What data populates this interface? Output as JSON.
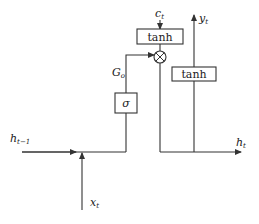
{
  "diagram": {
    "type": "lstm-output-gate",
    "colors": {
      "stroke": "#333333",
      "text": "#1a1a1a",
      "background": "#ffffff"
    },
    "labels": {
      "cell_state": "c",
      "cell_state_sub": "t",
      "output": "y",
      "output_sub": "t",
      "gate": "G",
      "gate_sub": "o",
      "prev_hidden": "h",
      "prev_hidden_sub": "t−1",
      "input": "x",
      "input_sub": "t",
      "hidden": "h",
      "hidden_sub": "t"
    },
    "boxes": {
      "top_tanh": "tanh",
      "right_tanh": "tanh",
      "sigma": "σ"
    },
    "operators": {
      "multiply": "elementwise-product"
    }
  }
}
